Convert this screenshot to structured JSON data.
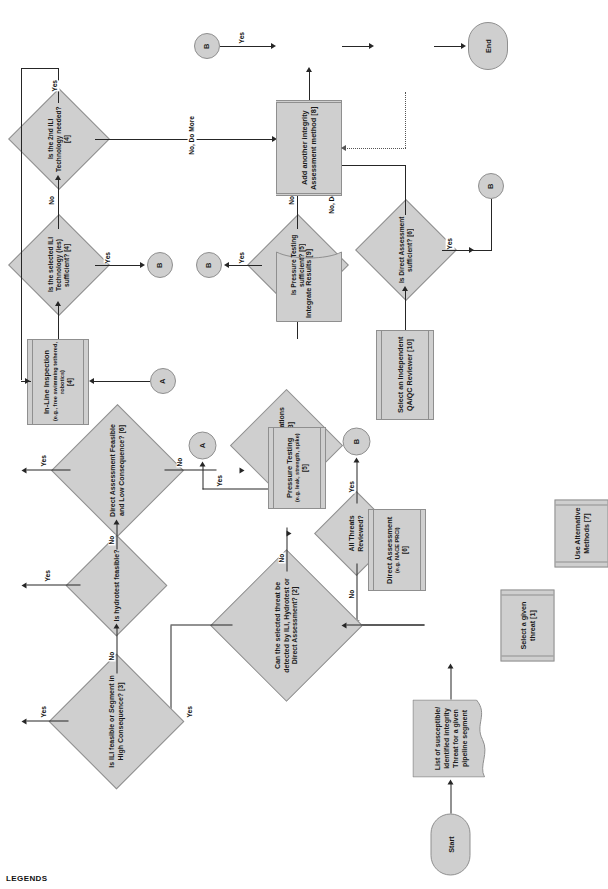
{
  "diagram": {
    "legends_caption": "LEGENDS",
    "colors": {
      "shape_fill": "#cfcfcf",
      "shape_stroke": "#8f8f8f",
      "line": "#262626",
      "dotted_line": "#555555",
      "text": "#1a1a1a",
      "background": "#ffffff"
    }
  },
  "nodes": {
    "start": {
      "label": "Start",
      "type": "terminator"
    },
    "threat_list": {
      "label": "List of susceptible/ identified integrity Threat for a given pipeline segment",
      "type": "document"
    },
    "select_threat": {
      "label": "Select a given threat [1]",
      "type": "predefined-process"
    },
    "can_detect": {
      "label": "Can the selected threat be detected by ILI, Hydrotest or Direct Assessment? [2]",
      "type": "decision"
    },
    "alt_methods": {
      "label": "Use Alternative Methods [7]",
      "type": "predefined-process"
    },
    "all_threats": {
      "label": "All Threats Reviewed?",
      "type": "decision"
    },
    "pipe_mods": {
      "label": "Can Pipe Modifications enable ILI? [3]",
      "type": "decision"
    },
    "ili_feasible": {
      "label": "Is ILI feasible or Segment in High Consequence? [3]",
      "type": "decision"
    },
    "hydrotest_feasible": {
      "label": "Is hydrotest feasible?",
      "type": "decision"
    },
    "da_feasible": {
      "label": "Direct Assessment Feasible and Low Consequence? [6]",
      "type": "decision"
    },
    "inline_inspection": {
      "label": "In-Line Inspection",
      "sub": "(e.g., free swimming tethered, robotics)",
      "ref": "[4]",
      "type": "predefined-process"
    },
    "pressure_testing": {
      "label": "Pressure Testing",
      "sub": "(e.g. leak, strength, spike)",
      "ref": "[5]",
      "type": "predefined-process"
    },
    "direct_assessment": {
      "label": "Direct Assessment",
      "sub": "(e.g. NACE PRCI)",
      "ref": "[6]",
      "type": "predefined-process"
    },
    "ili_sufficient": {
      "label": "Is the selected ILI Technology (ies) sufficient? [4]",
      "type": "decision"
    },
    "second_ili": {
      "label": "Is the 2nd ILI Technology needed? [4]",
      "type": "decision"
    },
    "pressure_sufficient": {
      "label": "Is Pressure Testing sufficient? [5]",
      "type": "decision"
    },
    "da_sufficient": {
      "label": "Is Direct Assessment sufficient? [6]",
      "type": "decision"
    },
    "add_method": {
      "label": "Add another integrity Assessment method [8]",
      "type": "process"
    },
    "integrate_results": {
      "label": "Integrate Results [9]",
      "type": "data-store"
    },
    "select_reviewer": {
      "label": "Select an Independent QA/QC Reviewer [10]",
      "type": "predefined-process"
    },
    "end": {
      "label": "End",
      "type": "terminator"
    },
    "conn_a1": {
      "label": "A",
      "type": "connector"
    },
    "conn_a2": {
      "label": "A",
      "type": "connector"
    },
    "conn_b1": {
      "label": "B",
      "type": "connector"
    },
    "conn_b2": {
      "label": "B",
      "type": "connector"
    },
    "conn_b3": {
      "label": "B",
      "type": "connector"
    }
  },
  "edge_labels": {
    "all_threats_no": "No",
    "all_threats_yes": "Yes",
    "can_detect_no": "No",
    "can_detect_yes": "Yes",
    "pipe_mods_no": "No",
    "pipe_mods_yes": "Yes",
    "ili_feasible_no": "No",
    "ili_feasible_yes": "Yes",
    "hydrotest_no": "No",
    "hydrotest_yes": "Yes",
    "da_feasible_no": "No",
    "da_feasible_yes": "Yes",
    "ili_sufficient_yes": "Yes",
    "ili_sufficient_no": "No",
    "second_ili_yes": "Yes",
    "second_ili_no_do_more": "No, Do More",
    "pressure_sufficient_yes": "Yes",
    "pressure_sufficient_no": "No",
    "da_sufficient_yes": "Yes",
    "da_sufficient_no_do_more": "No, Do More",
    "integrate_yes": "Yes"
  }
}
